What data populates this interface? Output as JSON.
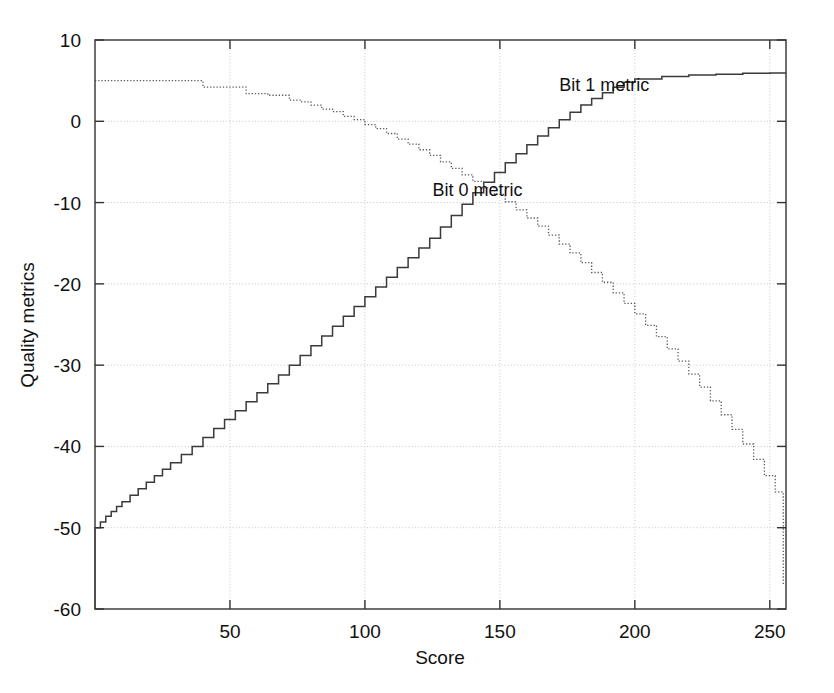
{
  "chart_data": {
    "type": "line",
    "title": "",
    "xlabel": "Score",
    "ylabel": "Quality metrics",
    "xlim": [
      0,
      256
    ],
    "ylim": [
      -60,
      10
    ],
    "xticks": [
      50,
      100,
      150,
      200,
      250
    ],
    "yticks": [
      10,
      0,
      -10,
      -20,
      -30,
      -40,
      -50,
      -60
    ],
    "xtick_labels": [
      "50",
      "100",
      "150",
      "200",
      "250"
    ],
    "ytick_labels": [
      "10",
      "0",
      "-10",
      "-20",
      "-30",
      "-40",
      "-50",
      "-60"
    ],
    "grid": true,
    "grid_style": "dotted",
    "legend": "inline-annotations",
    "series": [
      {
        "name": "Bit 1 metric",
        "label": "Bit 1 metric",
        "style": "solid",
        "color": "#3a3a3a",
        "annotation_x": 172,
        "annotation_y": 4.5,
        "x": [
          0,
          0,
          1,
          2,
          4,
          6,
          8,
          10,
          13,
          16,
          19,
          22,
          25,
          28,
          32,
          36,
          40,
          44,
          48,
          52,
          56,
          60,
          64,
          68,
          72,
          76,
          80,
          84,
          88,
          92,
          96,
          100,
          104,
          108,
          112,
          116,
          120,
          124,
          128,
          132,
          136,
          140,
          144,
          148,
          152,
          156,
          160,
          164,
          168,
          172,
          176,
          180,
          184,
          188,
          192,
          196,
          200,
          210,
          220,
          230,
          240,
          250,
          256
        ],
        "y": [
          -60,
          -50,
          -50,
          -49.3,
          -48.6,
          -48.0,
          -47.4,
          -46.8,
          -46.0,
          -45.2,
          -44.4,
          -43.6,
          -42.8,
          -42.0,
          -41.0,
          -40.0,
          -38.9,
          -37.8,
          -36.7,
          -35.6,
          -34.5,
          -33.4,
          -32.3,
          -31.2,
          -30.0,
          -28.8,
          -27.6,
          -26.4,
          -25.2,
          -24.0,
          -22.8,
          -21.6,
          -20.4,
          -19.2,
          -18.0,
          -16.8,
          -15.6,
          -14.4,
          -13.0,
          -11.6,
          -10.2,
          -8.8,
          -7.5,
          -6.3,
          -5.1,
          -4.0,
          -2.9,
          -1.8,
          -0.8,
          0.2,
          1.1,
          2.0,
          2.8,
          3.5,
          4.2,
          4.8,
          5.2,
          5.5,
          5.7,
          5.8,
          5.9,
          5.95,
          6.0
        ]
      },
      {
        "name": "Bit 0 metric",
        "label": "Bit 0 metric",
        "style": "dotted",
        "color": "#5a5a5a",
        "annotation_x": 125,
        "annotation_y": -8.4,
        "x": [
          0,
          10,
          20,
          30,
          36,
          40,
          46,
          52,
          56,
          60,
          64,
          68,
          72,
          76,
          80,
          84,
          88,
          92,
          96,
          100,
          104,
          108,
          112,
          116,
          120,
          124,
          128,
          132,
          136,
          140,
          144,
          148,
          152,
          156,
          160,
          164,
          168,
          172,
          176,
          180,
          184,
          188,
          192,
          196,
          200,
          204,
          208,
          212,
          216,
          220,
          224,
          228,
          232,
          236,
          240,
          244,
          248,
          252,
          255,
          255
        ],
        "y": [
          5.0,
          5.0,
          5.0,
          5.0,
          5.0,
          4.2,
          4.2,
          4.2,
          3.4,
          3.4,
          3.2,
          3.2,
          2.6,
          2.4,
          2.0,
          1.5,
          1.2,
          0.6,
          0.2,
          -0.4,
          -0.9,
          -1.5,
          -2.2,
          -2.8,
          -3.5,
          -4.2,
          -5.0,
          -5.8,
          -6.6,
          -7.4,
          -8.2,
          -9.0,
          -9.9,
          -10.9,
          -11.9,
          -12.9,
          -14.0,
          -15.1,
          -16.2,
          -17.4,
          -18.6,
          -19.8,
          -21.1,
          -22.4,
          -23.7,
          -25.1,
          -26.5,
          -28.0,
          -29.5,
          -31.1,
          -32.7,
          -34.4,
          -36.1,
          -37.9,
          -39.7,
          -41.6,
          -43.6,
          -45.6,
          -50.0,
          -57.0
        ]
      }
    ]
  },
  "axes": {
    "x_axis_title": "Score",
    "y_axis_title": "Quality metrics"
  }
}
